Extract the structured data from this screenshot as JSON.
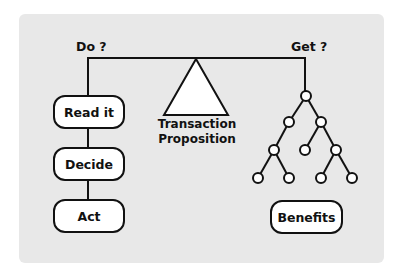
{
  "diagram": {
    "left_heading": "Do ?",
    "right_heading": "Get ?",
    "center_caption_line1": "Transaction",
    "center_caption_line2": "Proposition",
    "steps": [
      {
        "label": "Read it"
      },
      {
        "label": "Decide"
      },
      {
        "label": "Act"
      }
    ],
    "result_box": "Benefits",
    "tree_nodes": 10,
    "colors": {
      "panel": "#e8e8e8",
      "stroke": "#111111",
      "fill": "#ffffff"
    }
  }
}
